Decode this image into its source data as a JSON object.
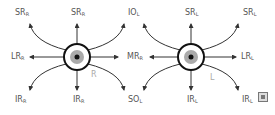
{
  "diagram": {
    "type": "extraocular-muscle-actions",
    "eyes": [
      {
        "side_label": "R",
        "center": [
          77,
          57
        ]
      },
      {
        "side_label": "L",
        "center": [
          191,
          57
        ]
      }
    ],
    "labels": {
      "r_sr_left": {
        "main": "SR",
        "sub": "R"
      },
      "r_sr_top": {
        "main": "SR",
        "sub": "R"
      },
      "io_top": {
        "main": "IO",
        "sub": "L"
      },
      "l_sr_top": {
        "main": "SR",
        "sub": "L"
      },
      "l_sr_right": {
        "main": "SR",
        "sub": "L"
      },
      "r_lr": {
        "main": "LR",
        "sub": "R"
      },
      "mr": {
        "main": "MR",
        "sub": "R"
      },
      "l_lr": {
        "main": "LR",
        "sub": "L"
      },
      "r_ir_left": {
        "main": "IR",
        "sub": "R"
      },
      "r_ir_bottom": {
        "main": "IR",
        "sub": "R"
      },
      "so_bottom": {
        "main": "SO",
        "sub": "L"
      },
      "l_ir_bottom": {
        "main": "IR",
        "sub": "L"
      },
      "l_ir_right": {
        "main": "IR",
        "sub": "L"
      }
    },
    "colors": {
      "line": "#333333",
      "iris": "#aaaaaa",
      "pupil": "#111111",
      "label": "#555555"
    }
  }
}
